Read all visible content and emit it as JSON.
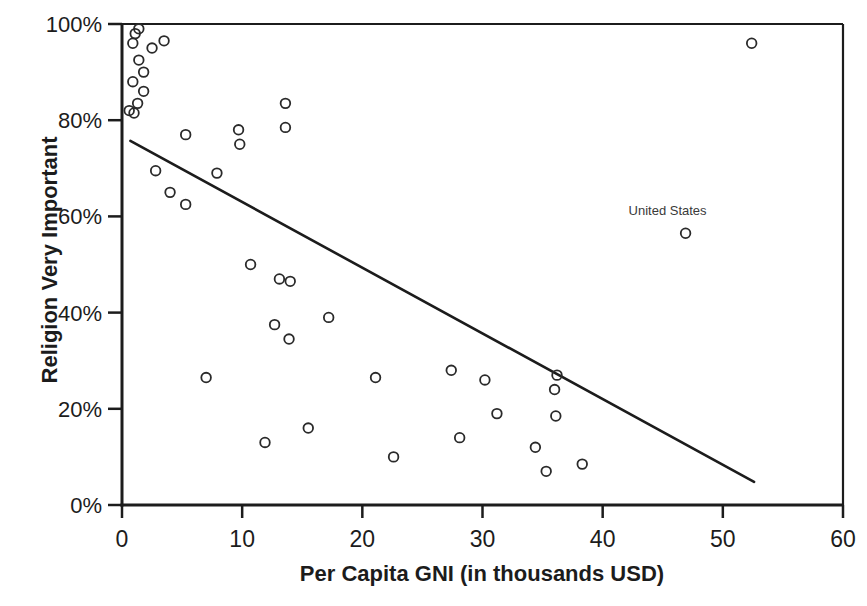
{
  "chart_data": {
    "type": "scatter",
    "title": "",
    "xlabel": "Per Capita GNI (in thousands USD)",
    "ylabel": "Religion Very Important",
    "xlim": [
      0,
      60
    ],
    "ylim": [
      0,
      100
    ],
    "x_ticks": [
      0,
      10,
      20,
      30,
      40,
      50,
      60
    ],
    "y_ticks": [
      0,
      20,
      40,
      60,
      80,
      100
    ],
    "y_tick_suffix": "%",
    "grid": false,
    "legend": false,
    "plot_border": true,
    "marker_style": "open-circle",
    "points": [
      [
        1.4,
        99
      ],
      [
        1.1,
        98
      ],
      [
        0.9,
        96
      ],
      [
        3.5,
        96.5
      ],
      [
        2.5,
        95
      ],
      [
        1.4,
        92.5
      ],
      [
        1.8,
        90
      ],
      [
        0.9,
        88
      ],
      [
        1.8,
        86
      ],
      [
        1.3,
        83.5
      ],
      [
        0.6,
        82
      ],
      [
        1.0,
        81.5
      ],
      [
        13.6,
        83.5
      ],
      [
        13.6,
        78.5
      ],
      [
        9.7,
        78
      ],
      [
        9.8,
        75
      ],
      [
        5.3,
        77
      ],
      [
        2.8,
        69.5
      ],
      [
        7.9,
        69
      ],
      [
        4.0,
        65
      ],
      [
        5.3,
        62.5
      ],
      [
        10.7,
        50
      ],
      [
        13.1,
        47
      ],
      [
        14.0,
        46.5
      ],
      [
        17.2,
        39
      ],
      [
        12.7,
        37.5
      ],
      [
        13.9,
        34.5
      ],
      [
        7.0,
        26.5
      ],
      [
        21.1,
        26.5
      ],
      [
        11.9,
        13
      ],
      [
        15.5,
        16
      ],
      [
        22.6,
        10
      ],
      [
        27.4,
        28
      ],
      [
        30.2,
        26
      ],
      [
        36.2,
        27
      ],
      [
        36.0,
        24
      ],
      [
        31.2,
        19
      ],
      [
        36.1,
        18.5
      ],
      [
        28.1,
        14
      ],
      [
        34.4,
        12
      ],
      [
        35.3,
        7
      ],
      [
        38.3,
        8.5
      ],
      [
        46.9,
        56.5
      ],
      [
        52.4,
        96
      ]
    ],
    "annotation": {
      "label": "United States",
      "x": 46.9,
      "y": 56.5,
      "position": "above-left"
    },
    "trendline": {
      "x1": 0.7,
      "y1": 75.7,
      "x2": 52.6,
      "y2": 4.8
    },
    "colors": {
      "background": "#ffffff",
      "axis": "#1c1c1c",
      "marker": "#2a2a2a",
      "trendline": "#1c1c1c"
    }
  }
}
